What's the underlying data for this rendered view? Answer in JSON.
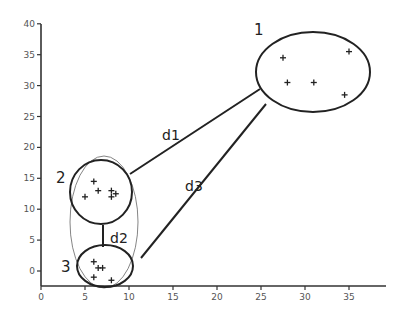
{
  "axes": {
    "x": {
      "ticks": [
        "0",
        "5",
        "10",
        "15",
        "20",
        "25",
        "30",
        "35"
      ],
      "values": [
        0,
        5,
        10,
        15,
        20,
        25,
        30,
        35
      ],
      "range": [
        0,
        40
      ]
    },
    "y": {
      "ticks": [
        "0",
        "5",
        "10",
        "15",
        "20",
        "25",
        "30",
        "35",
        "40"
      ],
      "values": [
        0,
        5,
        10,
        15,
        20,
        25,
        30,
        35,
        40
      ],
      "range": [
        -2,
        40
      ]
    }
  },
  "clusters": [
    {
      "label": "1",
      "points": [
        [
          27.5,
          34.5
        ],
        [
          35,
          35.5
        ],
        [
          28,
          30.5
        ],
        [
          31,
          30.5
        ],
        [
          34.5,
          28.5
        ]
      ]
    },
    {
      "label": "2",
      "points": [
        [
          6.0,
          14.5
        ],
        [
          6.5,
          13.0
        ],
        [
          8.0,
          13.0
        ],
        [
          5.0,
          12.0
        ],
        [
          8.0,
          12.0
        ],
        [
          8.5,
          12.5
        ]
      ]
    },
    {
      "label": "3",
      "points": [
        [
          6.0,
          1.5
        ],
        [
          6.5,
          0.5
        ],
        [
          7.0,
          0.5
        ],
        [
          6.0,
          -1.0
        ],
        [
          8.0,
          -1.5
        ]
      ]
    }
  ],
  "distances": [
    {
      "label": "d1",
      "from": "2",
      "to": "1"
    },
    {
      "label": "d2",
      "from": "2",
      "to": "3"
    },
    {
      "label": "d3",
      "from": "3",
      "to": "1"
    }
  ],
  "chart_data": {
    "type": "scatter",
    "title": "",
    "xlabel": "",
    "ylabel": "",
    "xlim": [
      0,
      40
    ],
    "ylim": [
      -2,
      40
    ],
    "x_ticks": [
      0,
      5,
      10,
      15,
      20,
      25,
      30,
      35
    ],
    "y_ticks": [
      0,
      5,
      10,
      15,
      20,
      25,
      30,
      35,
      40
    ],
    "grid": false,
    "series": [
      {
        "name": "Cluster 1",
        "x": [
          27.5,
          35,
          28,
          31,
          34.5
        ],
        "y": [
          34.5,
          35.5,
          30.5,
          30.5,
          28.5
        ]
      },
      {
        "name": "Cluster 2",
        "x": [
          6.0,
          6.5,
          8.0,
          5.0,
          8.0,
          8.5
        ],
        "y": [
          14.5,
          13.0,
          13.0,
          12.0,
          12.0,
          12.5
        ]
      },
      {
        "name": "Cluster 3",
        "x": [
          6.0,
          6.5,
          7.0,
          6.0,
          8.0
        ],
        "y": [
          1.5,
          0.5,
          0.5,
          -1.0,
          -1.5
        ]
      }
    ],
    "annotations": [
      "1",
      "2",
      "3",
      "d1",
      "d2",
      "d3"
    ]
  }
}
